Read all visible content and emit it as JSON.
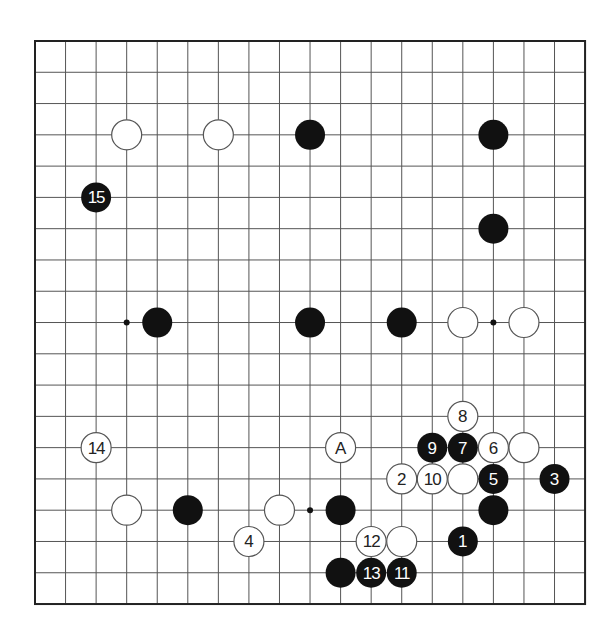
{
  "board": {
    "size": 19,
    "origin": {
      "x": 35,
      "y": 41
    },
    "spacing": {
      "x": 30.56,
      "y": 31.28
    },
    "stone_radius": 15,
    "colors": {
      "background": "#ffffff",
      "line": "#555555",
      "border": "#222222",
      "black_stone": "#111111",
      "white_stone_fill": "#ffffff",
      "white_stone_outline": "#555555",
      "black_label": "#ffffff",
      "white_label": "#222222"
    },
    "star_points": [
      {
        "col": 3,
        "row": 9
      },
      {
        "col": 15,
        "row": 9
      },
      {
        "col": 9,
        "row": 15
      }
    ],
    "stones": [
      {
        "color": "white",
        "col": 3,
        "row": 3,
        "label": ""
      },
      {
        "color": "white",
        "col": 6,
        "row": 3,
        "label": ""
      },
      {
        "color": "black",
        "col": 9,
        "row": 3,
        "label": ""
      },
      {
        "color": "black",
        "col": 15,
        "row": 3,
        "label": ""
      },
      {
        "color": "black",
        "col": 2,
        "row": 5,
        "label": "15"
      },
      {
        "color": "black",
        "col": 15,
        "row": 6,
        "label": ""
      },
      {
        "color": "black",
        "col": 4,
        "row": 9,
        "label": ""
      },
      {
        "color": "black",
        "col": 9,
        "row": 9,
        "label": ""
      },
      {
        "color": "black",
        "col": 12,
        "row": 9,
        "label": ""
      },
      {
        "color": "white",
        "col": 14,
        "row": 9,
        "label": ""
      },
      {
        "color": "white",
        "col": 16,
        "row": 9,
        "label": ""
      },
      {
        "color": "white",
        "col": 14,
        "row": 12,
        "label": "8"
      },
      {
        "color": "white",
        "col": 2,
        "row": 13,
        "label": "14"
      },
      {
        "color": "white",
        "col": 10,
        "row": 13,
        "label": "A"
      },
      {
        "color": "black",
        "col": 13,
        "row": 13,
        "label": "9"
      },
      {
        "color": "black",
        "col": 14,
        "row": 13,
        "label": "7"
      },
      {
        "color": "white",
        "col": 15,
        "row": 13,
        "label": "6"
      },
      {
        "color": "white",
        "col": 16,
        "row": 13,
        "label": ""
      },
      {
        "color": "white",
        "col": 12,
        "row": 14,
        "label": "2"
      },
      {
        "color": "white",
        "col": 13,
        "row": 14,
        "label": "10"
      },
      {
        "color": "white",
        "col": 14,
        "row": 14,
        "label": ""
      },
      {
        "color": "black",
        "col": 15,
        "row": 14,
        "label": "5"
      },
      {
        "color": "black",
        "col": 17,
        "row": 14,
        "label": "3"
      },
      {
        "color": "white",
        "col": 3,
        "row": 15,
        "label": ""
      },
      {
        "color": "black",
        "col": 5,
        "row": 15,
        "label": ""
      },
      {
        "color": "white",
        "col": 8,
        "row": 15,
        "label": ""
      },
      {
        "color": "black",
        "col": 10,
        "row": 15,
        "label": ""
      },
      {
        "color": "black",
        "col": 15,
        "row": 15,
        "label": ""
      },
      {
        "color": "white",
        "col": 7,
        "row": 16,
        "label": "4"
      },
      {
        "color": "white",
        "col": 11,
        "row": 16,
        "label": "12"
      },
      {
        "color": "white",
        "col": 12,
        "row": 16,
        "label": ""
      },
      {
        "color": "black",
        "col": 14,
        "row": 16,
        "label": "1"
      },
      {
        "color": "black",
        "col": 10,
        "row": 17,
        "label": ""
      },
      {
        "color": "black",
        "col": 11,
        "row": 17,
        "label": "13"
      },
      {
        "color": "black",
        "col": 12,
        "row": 17,
        "label": "11"
      }
    ]
  }
}
